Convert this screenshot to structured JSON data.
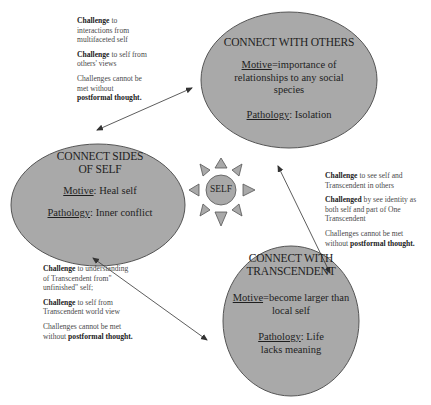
{
  "diagram": {
    "colors": {
      "ellipse_fill": "#a9a9a9",
      "ellipse_stroke": "#555555",
      "arrow": "#333333",
      "background": "#ffffff"
    },
    "center": {
      "label": "SELF",
      "icon": "sun-icon"
    },
    "nodes": [
      {
        "id": "others",
        "title": "CONNECT WITH OTHERS",
        "motive_label": "Motive",
        "motive_text": "=importance of relationships to any social species",
        "pathology_label": "Pathology",
        "pathology_text": ": Isolation"
      },
      {
        "id": "self",
        "title_line1": "CONNECT SIDES",
        "title_line2": "OF SELF",
        "motive_label": "Motive",
        "motive_text": ": Heal self",
        "pathology_label": "Pathology",
        "pathology_text": ": Inner conflict"
      },
      {
        "id": "transcendent",
        "title_line1": "CONNECT WITH",
        "title_line2": "TRANSCENDENT",
        "motive_label": "Motive",
        "motive_text": "=become larger than local self",
        "pathology_label": "Pathology",
        "pathology_text": ": Life lacks meaning"
      }
    ],
    "notes": {
      "self_others": {
        "c1_bold": "Challenge",
        "c1_text": " to interactions from multifaceted self",
        "c2_bold": "Challenge",
        "c2_text": " to self from others' views",
        "c3_text": "Challenges cannot be met without ",
        "c3_bold": "postformal thought",
        "c3_end": "."
      },
      "others_transcendent": {
        "c1_bold": "Challenge",
        "c1_text": " to see self and Transcendent in others",
        "c2_bold": "Challenged",
        "c2_text": " by see identity as both self and part of One Transcendent",
        "c3_text": "Challenges cannot be met without ",
        "c3_bold": "postformal thought",
        "c3_end": "."
      },
      "self_transcendent": {
        "c1_bold": "Challenge",
        "c1_text": " to understanding of Transcendent from\" unfinished\" self;",
        "c2_bold": "Challenge",
        "c2_text": " to self from Transcendent world view",
        "c3_text": "Challenges cannot be met without ",
        "c3_bold": "postformal thought",
        "c3_end": "."
      }
    }
  }
}
